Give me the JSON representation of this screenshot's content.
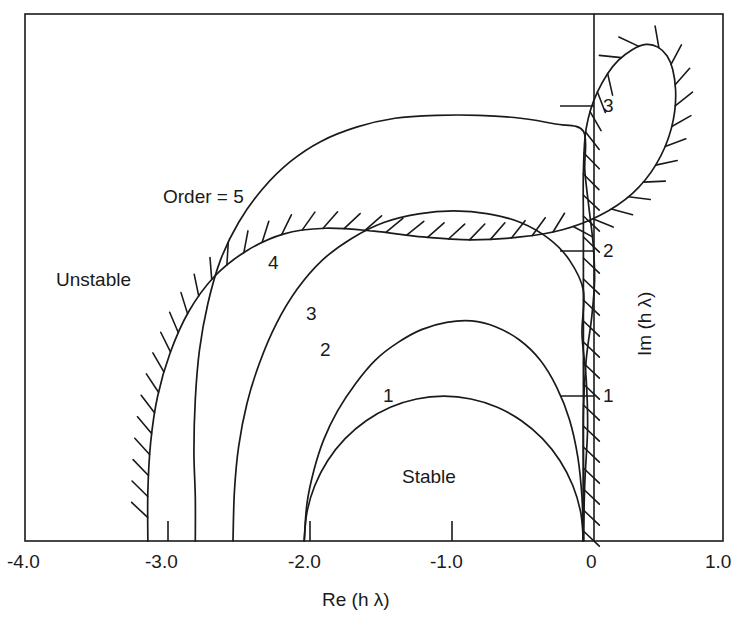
{
  "figure": {
    "title": "",
    "frame_color": "#1a1a1a",
    "curve_color": "#1a1a1a",
    "background": "#ffffff"
  },
  "axes": {
    "x_title": "Re (h λ)",
    "y_title": "Im (h λ)",
    "x_ticks": [
      {
        "value": -4.0,
        "label": "-4.0"
      },
      {
        "value": -3.0,
        "label": "-3.0"
      },
      {
        "value": -2.0,
        "label": "-2.0"
      },
      {
        "value": -1.0,
        "label": "-1.0"
      },
      {
        "value": 0.0,
        "label": "0"
      },
      {
        "value": 1.0,
        "label": "1.0"
      }
    ],
    "y_ticks": [
      {
        "value": 1.0,
        "label": "1"
      },
      {
        "value": 2.0,
        "label": "2"
      },
      {
        "value": 3.0,
        "label": "3"
      }
    ],
    "xlim": [
      -4.0,
      1.0
    ],
    "ylim": [
      0.0,
      3.64
    ],
    "grid": false
  },
  "annotations": {
    "unstable": "Unstable",
    "stable": "Stable",
    "order5": "Order = 5",
    "order4": "4",
    "order3": "3",
    "order2": "2",
    "order1": "1"
  },
  "chart_data": {
    "type": "line",
    "xlabel": "Re (h λ)",
    "ylabel": "Im (h λ)",
    "xlim": [
      -4.0,
      1.0
    ],
    "ylim": [
      0.0,
      3.64
    ],
    "grid": false,
    "legend_position": "inline-labels",
    "hatching": {
      "on_series": "Order = 5",
      "side": "outer",
      "meaning": "unstable side"
    },
    "series": [
      {
        "name": "Order = 1",
        "order": 1,
        "label": "1",
        "real_axis_intercept": -2.0,
        "imag_axis_intercept": 0.0,
        "apex": [
          -1.0,
          1.0
        ],
        "points": [
          [
            0.0,
            0.0
          ],
          [
            -0.019,
            0.195
          ],
          [
            -0.076,
            0.383
          ],
          [
            -0.169,
            0.556
          ],
          [
            -0.293,
            0.707
          ],
          [
            -0.444,
            0.831
          ],
          [
            -0.617,
            0.924
          ],
          [
            -0.805,
            0.981
          ],
          [
            -1.0,
            1.0
          ],
          [
            -1.195,
            0.981
          ],
          [
            -1.383,
            0.924
          ],
          [
            -1.556,
            0.831
          ],
          [
            -1.707,
            0.707
          ],
          [
            -1.831,
            0.556
          ],
          [
            -1.924,
            0.383
          ],
          [
            -1.981,
            0.195
          ],
          [
            -2.0,
            0.0
          ]
        ]
      },
      {
        "name": "Order = 2",
        "order": 2,
        "label": "2",
        "real_axis_intercept": -2.0,
        "imag_axis_intercept": 0.0,
        "apex": [
          -0.72,
          1.52
        ],
        "points": [
          [
            0.0,
            0.0
          ],
          [
            -0.01,
            0.3
          ],
          [
            -0.04,
            0.58
          ],
          [
            -0.1,
            0.84
          ],
          [
            -0.19,
            1.06
          ],
          [
            -0.31,
            1.25
          ],
          [
            -0.46,
            1.39
          ],
          [
            -0.63,
            1.48
          ],
          [
            -0.8,
            1.52
          ],
          [
            -0.98,
            1.51
          ],
          [
            -1.16,
            1.46
          ],
          [
            -1.33,
            1.37
          ],
          [
            -1.49,
            1.25
          ],
          [
            -1.63,
            1.09
          ],
          [
            -1.76,
            0.9
          ],
          [
            -1.86,
            0.7
          ],
          [
            -1.93,
            0.49
          ],
          [
            -1.98,
            0.26
          ],
          [
            -2.0,
            0.0
          ]
        ]
      },
      {
        "name": "Order = 3",
        "order": 3,
        "label": "3",
        "real_axis_intercept": -2.51,
        "imag_axis_intercept": 1.73,
        "apex": [
          -1.05,
          2.28
        ],
        "points": [
          [
            0.0,
            0.0
          ],
          [
            0.01,
            0.4
          ],
          [
            0.03,
            0.78
          ],
          [
            0.02,
            1.12
          ],
          [
            -0.01,
            1.43
          ],
          [
            0.0,
            1.73
          ],
          [
            -0.1,
            1.94
          ],
          [
            -0.25,
            2.09
          ],
          [
            -0.45,
            2.2
          ],
          [
            -0.68,
            2.26
          ],
          [
            -0.93,
            2.28
          ],
          [
            -1.18,
            2.26
          ],
          [
            -1.43,
            2.2
          ],
          [
            -1.66,
            2.09
          ],
          [
            -1.87,
            1.94
          ],
          [
            -2.05,
            1.74
          ],
          [
            -2.2,
            1.5
          ],
          [
            -2.32,
            1.23
          ],
          [
            -2.41,
            0.95
          ],
          [
            -2.47,
            0.65
          ],
          [
            -2.5,
            0.34
          ],
          [
            -2.51,
            0.0
          ]
        ]
      },
      {
        "name": "Order = 4",
        "order": 4,
        "label": "4",
        "real_axis_intercept": -2.78,
        "imag_axis_intercept": 2.83,
        "apex": [
          -1.55,
          2.9
        ],
        "points": [
          [
            0.0,
            0.0
          ],
          [
            0.0,
            0.45
          ],
          [
            0.0,
            0.9
          ],
          [
            0.02,
            1.25
          ],
          [
            0.06,
            1.55
          ],
          [
            0.08,
            1.8
          ],
          [
            0.07,
            2.05
          ],
          [
            0.04,
            2.3
          ],
          [
            0.01,
            2.56
          ],
          [
            0.0,
            2.83
          ],
          [
            -0.2,
            2.88
          ],
          [
            -0.45,
            2.92
          ],
          [
            -0.75,
            2.94
          ],
          [
            -1.05,
            2.94
          ],
          [
            -1.35,
            2.92
          ],
          [
            -1.62,
            2.86
          ],
          [
            -1.88,
            2.76
          ],
          [
            -2.1,
            2.62
          ],
          [
            -2.3,
            2.43
          ],
          [
            -2.47,
            2.2
          ],
          [
            -2.6,
            1.94
          ],
          [
            -2.69,
            1.64
          ],
          [
            -2.75,
            1.32
          ],
          [
            -2.78,
            0.98
          ],
          [
            -2.79,
            0.62
          ],
          [
            -2.78,
            0.3
          ],
          [
            -2.78,
            0.0
          ]
        ]
      },
      {
        "name": "Order = 5",
        "order": 5,
        "label": "Order = 5",
        "real_axis_intercept": -3.12,
        "imag_axis_intercept": 3.4,
        "apex": [
          0.25,
          3.43
        ],
        "max_real": 0.63,
        "points": [
          [
            0.0,
            0.0
          ],
          [
            0.0,
            0.5
          ],
          [
            0.0,
            1.0
          ],
          [
            0.0,
            1.45
          ],
          [
            0.0,
            1.85
          ],
          [
            0.0,
            2.2
          ],
          [
            0.0,
            2.55
          ],
          [
            0.02,
            2.85
          ],
          [
            0.1,
            3.1
          ],
          [
            0.25,
            3.32
          ],
          [
            0.45,
            3.43
          ],
          [
            0.6,
            3.35
          ],
          [
            0.66,
            3.12
          ],
          [
            0.63,
            2.85
          ],
          [
            0.52,
            2.6
          ],
          [
            0.35,
            2.4
          ],
          [
            0.12,
            2.25
          ],
          [
            -0.15,
            2.15
          ],
          [
            -0.45,
            2.1
          ],
          [
            -0.8,
            2.08
          ],
          [
            -1.15,
            2.1
          ],
          [
            -1.5,
            2.14
          ],
          [
            -1.85,
            2.16
          ],
          [
            -2.15,
            2.12
          ],
          [
            -2.42,
            2.0
          ],
          [
            -2.65,
            1.82
          ],
          [
            -2.83,
            1.58
          ],
          [
            -2.96,
            1.3
          ],
          [
            -3.05,
            1.0
          ],
          [
            -3.1,
            0.68
          ],
          [
            -3.12,
            0.34
          ],
          [
            -3.12,
            0.0
          ]
        ]
      }
    ]
  }
}
